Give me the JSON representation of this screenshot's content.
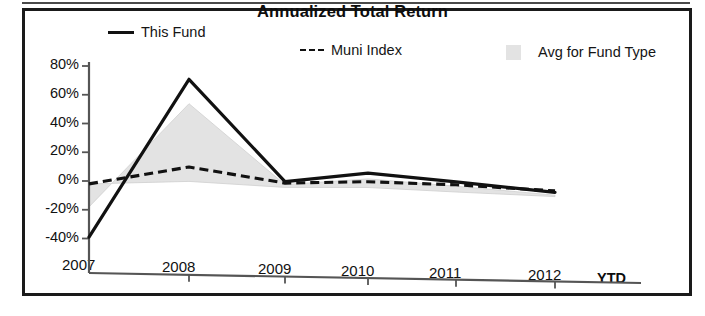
{
  "chart_data": {
    "type": "line",
    "title": "Annualized Total Return",
    "xlabel": "",
    "ylabel": "",
    "categories": [
      "2007",
      "2008",
      "2009",
      "2010",
      "2011",
      "2012"
    ],
    "x_tick_labels": [
      "2007",
      "2008",
      "2009",
      "2010",
      "2011",
      "2012"
    ],
    "x_axis_suffix_label": "YTD",
    "y_tick_labels": [
      "80%",
      "60%",
      "40%",
      "20%",
      "0%",
      "-20%",
      "-40%"
    ],
    "y_tick_values": [
      80,
      60,
      40,
      20,
      0,
      -20,
      -40
    ],
    "ylim": [
      -40,
      80
    ],
    "y_unit": "%",
    "grid": false,
    "legend_position": "top",
    "series": [
      {
        "name": "This Fund",
        "style": "solid-line",
        "color": "#111111",
        "values": [
          -39,
          72,
          2,
          9,
          4,
          -2
        ]
      },
      {
        "name": "Muni Index",
        "style": "dashed-line",
        "color": "#111111",
        "values": [
          -2,
          11,
          1,
          3,
          2,
          -1
        ]
      },
      {
        "name": "Avg for Fund Type",
        "style": "filled-area",
        "color": "#e3e3e3",
        "values": [
          -18,
          55,
          0,
          5,
          1,
          -4
        ],
        "baseline_values": [
          -2,
          1,
          -2,
          -1,
          -3,
          -5
        ]
      }
    ]
  },
  "legend": {
    "items": [
      {
        "label": "This Fund",
        "marker": "solid-line-swatch"
      },
      {
        "label": "Muni Index",
        "marker": "dashed-line-swatch"
      },
      {
        "label": "Avg for Fund Type",
        "marker": "gray-square-swatch"
      }
    ]
  },
  "colors": {
    "line": "#111111",
    "area_fill": "#e3e3e3",
    "axis": "#555555",
    "border": "#1a1a1a"
  }
}
